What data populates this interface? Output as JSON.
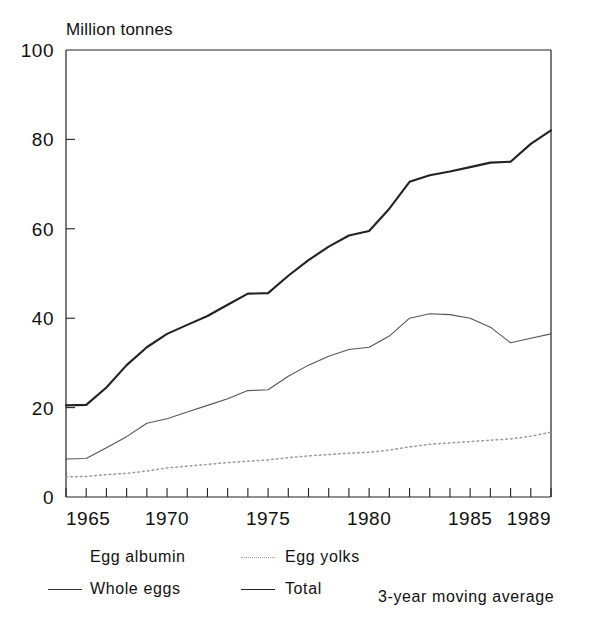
{
  "chart_data": {
    "type": "line",
    "title": "",
    "ylabel": "Million tonnes",
    "xlabel": "",
    "ylim": [
      0,
      100
    ],
    "xlim": [
      1965,
      1989
    ],
    "yticks": [
      0,
      20,
      40,
      60,
      80,
      100
    ],
    "xticks": [
      1965,
      1970,
      1975,
      1980,
      1985,
      1989
    ],
    "xtick_labels": [
      "1965",
      "1970",
      "1975",
      "1980",
      "1985",
      "1989"
    ],
    "ytick_labels": [
      "0",
      "20",
      "40",
      "60",
      "80",
      "100"
    ],
    "minor_xticks_every": 1,
    "grid": false,
    "legend_position": "below-plot",
    "annotation": "3-year moving average",
    "x": [
      1965,
      1966,
      1967,
      1968,
      1969,
      1970,
      1971,
      1972,
      1973,
      1974,
      1975,
      1976,
      1977,
      1978,
      1979,
      1980,
      1981,
      1982,
      1983,
      1984,
      1985,
      1986,
      1987,
      1988,
      1989
    ],
    "series": [
      {
        "name": "Total",
        "style": "solid-thick",
        "color": "#222222",
        "values": [
          20.5,
          20.6,
          24.5,
          29.5,
          33.5,
          36.5,
          38.5,
          40.5,
          43.0,
          45.5,
          45.6,
          49.5,
          53.0,
          56.0,
          58.5,
          59.5,
          64.5,
          70.5,
          72.0,
          72.8,
          73.8,
          74.8,
          75.0,
          79.0,
          82.0
        ]
      },
      {
        "name": "Whole eggs",
        "style": "solid-thin",
        "color": "#555555",
        "values": [
          8.5,
          8.6,
          11.0,
          13.5,
          16.5,
          17.5,
          19.0,
          20.5,
          22.0,
          23.8,
          24.0,
          27.0,
          29.5,
          31.5,
          33.0,
          33.5,
          36.0,
          40.0,
          41.0,
          40.8,
          40.0,
          38.0,
          34.5,
          35.5,
          36.5
        ]
      },
      {
        "name": "Egg yolks",
        "style": "dotted",
        "color": "#999999",
        "values": [
          4.5,
          4.6,
          5.0,
          5.3,
          5.8,
          6.5,
          6.9,
          7.3,
          7.7,
          8.0,
          8.3,
          8.8,
          9.2,
          9.5,
          9.8,
          10.0,
          10.5,
          11.2,
          11.8,
          12.1,
          12.4,
          12.7,
          13.0,
          13.6,
          14.5
        ]
      }
    ]
  },
  "legend": {
    "items": [
      {
        "label": "Egg albumin",
        "style": "blank"
      },
      {
        "label": "Egg yolks",
        "style": "dotted"
      },
      {
        "label": "Whole eggs",
        "style": "solid-thin"
      },
      {
        "label": "Total",
        "style": "solid-thick"
      }
    ],
    "note": "3-year moving average"
  }
}
